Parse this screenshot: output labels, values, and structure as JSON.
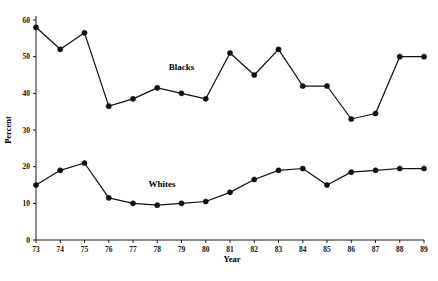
{
  "chart_data": {
    "type": "line",
    "title": "",
    "xlabel": "Year",
    "ylabel": "Percent",
    "x": [
      73,
      74,
      75,
      76,
      77,
      78,
      79,
      80,
      81,
      82,
      83,
      84,
      85,
      86,
      87,
      88,
      89
    ],
    "xtick_labels": [
      "73",
      "74",
      "75",
      "76",
      "77",
      "78",
      "79",
      "80",
      "81",
      "82",
      "83",
      "84",
      "85",
      "86",
      "87",
      "88",
      "89"
    ],
    "ytick_labels": [
      "0",
      "10",
      "20",
      "30",
      "40",
      "50",
      "60"
    ],
    "yticks": [
      0,
      10,
      20,
      30,
      40,
      50,
      60
    ],
    "xlim": [
      73,
      89
    ],
    "ylim": [
      0,
      60
    ],
    "grid": false,
    "legend_position": "inline-annotation",
    "series": [
      {
        "name": "Blacks",
        "label": "Blacks",
        "color": "#111111",
        "marker": "filled-circle",
        "values": [
          58,
          52,
          56.5,
          36.5,
          38.5,
          41.5,
          40,
          38.5,
          51,
          45,
          52,
          42,
          42,
          33,
          34.5,
          50,
          50
        ]
      },
      {
        "name": "Whites",
        "label": "Whites",
        "color": "#111111",
        "marker": "filled-circle",
        "values": [
          15,
          19,
          21,
          11.5,
          10,
          9.5,
          10,
          10.5,
          13,
          16.5,
          19,
          19.5,
          15,
          18.5,
          19,
          19.5,
          19.5
        ]
      }
    ],
    "annotations": [
      {
        "text": "Blacks",
        "x": 79.0,
        "y": 46.5
      },
      {
        "text": "Whites",
        "x": 78.2,
        "y": 14.5
      }
    ]
  },
  "caption": {
    "text": ""
  }
}
